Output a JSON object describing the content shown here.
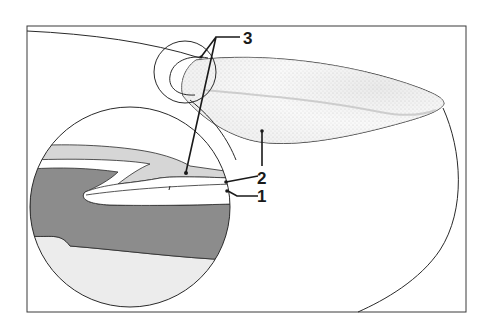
{
  "figure": {
    "type": "anatomical cross-section diagram",
    "labels": [
      {
        "id": "3",
        "text": "3"
      },
      {
        "id": "2",
        "text": "2"
      },
      {
        "id": "1",
        "text": "1"
      }
    ],
    "colors": {
      "line": "#2a2a2a",
      "dark_band": "#8c8c8c",
      "light_band": "#d6d6d6",
      "pale_fill": "#ececec",
      "stipple": "#c8c8c8",
      "background": "#ffffff"
    }
  }
}
